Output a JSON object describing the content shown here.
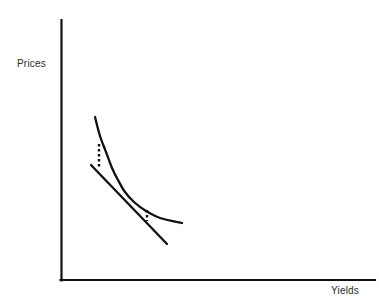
{
  "figure": {
    "background_color": "#ffffff",
    "ink_color": "#111111",
    "label_color": "#2b2b2b",
    "width": 379,
    "height": 307
  },
  "axes": {
    "y_axis": {
      "name": "prices-axis",
      "x": 61,
      "y_top": 20,
      "y_bottom": 280
    },
    "x_axis": {
      "name": "yields-axis",
      "y": 280,
      "x_left": 61,
      "x_right": 375
    },
    "ylabel": "Prices",
    "xlabel": "Yields"
  },
  "chart_data": {
    "type": "line",
    "title": "",
    "xlabel": "Yields",
    "ylabel": "Prices",
    "grid": false,
    "legend": null,
    "axis_ticks": {
      "x": [],
      "y": []
    },
    "xlim": [
      61,
      375
    ],
    "ylim": [
      20,
      280
    ],
    "series": [
      {
        "name": "price-yield-curve",
        "style": "solid",
        "description": "Convex decreasing price-yield curve",
        "points": [
          [
            95,
            117
          ],
          [
            100,
            136
          ],
          [
            106,
            152
          ],
          [
            112,
            168
          ],
          [
            118,
            180
          ],
          [
            125,
            192
          ],
          [
            134,
            202
          ],
          [
            146,
            211
          ],
          [
            160,
            218
          ],
          [
            182,
            223
          ]
        ]
      },
      {
        "name": "tangent-duration-line",
        "style": "solid",
        "description": "Straight tangent line representing duration approximation",
        "points": [
          [
            91,
            165
          ],
          [
            125,
            192
          ],
          [
            167,
            244
          ]
        ]
      },
      {
        "name": "convexity-gap-upper",
        "style": "dotted",
        "description": "Vertical dotted gap between curve and tangent at low yield",
        "points": [
          [
            99,
            144
          ],
          [
            99,
            168
          ]
        ]
      },
      {
        "name": "convexity-gap-lower",
        "style": "dotted",
        "description": "Vertical dotted gap between curve and tangent at high yield",
        "points": [
          [
            147,
            210
          ],
          [
            147,
            221
          ]
        ]
      }
    ],
    "annotations": [
      {
        "text": "Prices",
        "role": "y-axis-label",
        "x": 17,
        "y": 62
      },
      {
        "text": "Yields",
        "role": "x-axis-label",
        "x": 331,
        "y": 291
      }
    ]
  }
}
